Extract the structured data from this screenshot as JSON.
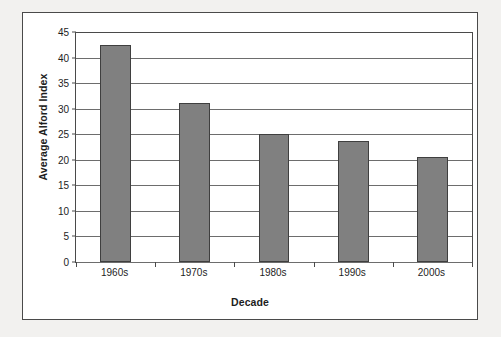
{
  "chart_data": {
    "type": "bar",
    "title": "",
    "xlabel": "Decade",
    "ylabel": "Average Alford Index",
    "categories": [
      "1960s",
      "1970s",
      "1980s",
      "1990s",
      "2000s"
    ],
    "values": [
      42.4,
      31.1,
      25.1,
      23.7,
      20.6
    ],
    "series": [
      {
        "name": "Average Alford Index",
        "values": [
          42.4,
          31.1,
          25.1,
          23.7,
          20.6
        ]
      }
    ],
    "ylim": [
      0,
      45
    ],
    "ytick_step": 5,
    "yticks": [
      "0",
      "5",
      "10",
      "15",
      "20",
      "25",
      "30",
      "35",
      "40",
      "45"
    ],
    "grid": "horizontal",
    "legend": "none",
    "bar_color": "#808080",
    "bar_edge_color": "#3f3f3f",
    "gridline_color": "#6d6d6d",
    "axis_color": "#4a4a4a",
    "plot_background": "#ffffff",
    "figure_background": "#f2f1ef"
  }
}
